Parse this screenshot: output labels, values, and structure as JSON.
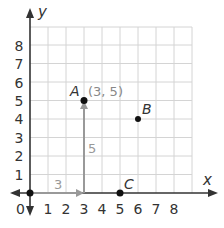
{
  "diagram": {
    "x_axis_label": "x",
    "y_axis_label": "y",
    "origin_label": "0",
    "x_ticks": [
      "1",
      "2",
      "3",
      "4",
      "5",
      "6",
      "7",
      "8"
    ],
    "y_ticks": [
      "1",
      "2",
      "3",
      "4",
      "5",
      "6",
      "7",
      "8"
    ],
    "grid": {
      "x_min": 0,
      "x_max": 9,
      "y_min": 0,
      "y_max": 9
    },
    "points": [
      {
        "name": "A",
        "x": 3,
        "y": 5,
        "coord_label": "(3, 5)"
      },
      {
        "name": "B",
        "x": 6,
        "y": 4
      },
      {
        "name": "C",
        "x": 5,
        "y": 0
      }
    ],
    "arrows": [
      {
        "label": "3",
        "from": [
          0,
          0
        ],
        "to": [
          3,
          0
        ],
        "direction": "horizontal"
      },
      {
        "label": "5",
        "from": [
          3,
          0
        ],
        "to": [
          3,
          5
        ],
        "direction": "vertical"
      }
    ],
    "colors": {
      "axis": "#333333",
      "grid": "#d4d4d4",
      "arrow": "#999999",
      "point": "#111111"
    }
  }
}
